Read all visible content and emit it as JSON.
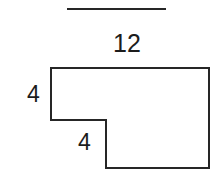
{
  "figure": {
    "kind": "l-shaped-polygon-with-dimensions",
    "background_color": "#ffffff",
    "stroke_color": "#262626",
    "stroke_width": 2,
    "text_color": "#1c1c1c",
    "separator": {
      "name": "top-rule",
      "x1": 67,
      "y1": 9,
      "x2": 166,
      "y2": 9,
      "thickness": 2
    },
    "outline_points": "51,68 209,68 209,168 106,168 106,120 51,120",
    "labels": {
      "top_length": "12",
      "left_height": "4",
      "inner_height": "4"
    }
  }
}
